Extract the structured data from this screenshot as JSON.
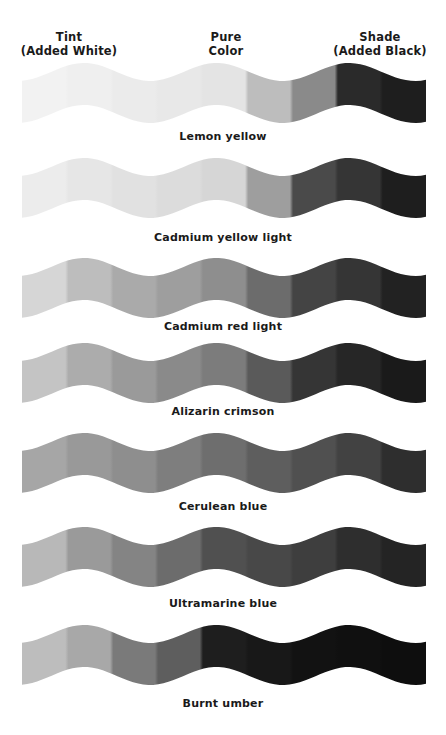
{
  "headers": {
    "tint": {
      "line1": "Tint",
      "line2": "(Added White)"
    },
    "pure": {
      "line1": "Pure",
      "line2": "Color"
    },
    "shade": {
      "line1": "Shade",
      "line2": "(Added Black)"
    }
  },
  "strips": [
    {
      "label": "Lemon yellow",
      "top": 58,
      "labelTop": 130,
      "grays": [
        "#f2f2f2",
        "#efefef",
        "#ebebeb",
        "#e8e8e8",
        "#e4e4e4",
        "#bdbdbd",
        "#8a8a8a",
        "#2a2a2a",
        "#1e1e1e"
      ]
    },
    {
      "label": "Cadmium yellow light",
      "top": 153,
      "labelTop": 231,
      "grays": [
        "#ececec",
        "#e6e6e6",
        "#e1e1e1",
        "#dcdcdc",
        "#d6d6d6",
        "#9e9e9e",
        "#4a4a4a",
        "#353535",
        "#1e1e1e"
      ]
    },
    {
      "label": "Cadmium red light",
      "top": 253,
      "labelTop": 320,
      "grays": [
        "#d6d6d6",
        "#bdbdbd",
        "#aaaaaa",
        "#9e9e9e",
        "#8e8e8e",
        "#6c6c6c",
        "#444444",
        "#353535",
        "#222222"
      ]
    },
    {
      "label": "Alizarin crimson",
      "top": 338,
      "labelTop": 405,
      "grays": [
        "#c4c4c4",
        "#acacac",
        "#9a9a9a",
        "#8a8a8a",
        "#7c7c7c",
        "#5a5a5a",
        "#353535",
        "#262626",
        "#1a1a1a"
      ]
    },
    {
      "label": "Cerulean blue",
      "top": 428,
      "labelTop": 500,
      "grays": [
        "#a6a6a6",
        "#999999",
        "#8e8e8e",
        "#7e7e7e",
        "#6e6e6e",
        "#5e5e5e",
        "#505050",
        "#424242",
        "#2e2e2e"
      ]
    },
    {
      "label": "Ultramarine blue",
      "top": 522,
      "labelTop": 597,
      "grays": [
        "#b8b8b8",
        "#9a9a9a",
        "#848484",
        "#6c6c6c",
        "#505050",
        "#484848",
        "#3e3e3e",
        "#2e2e2e",
        "#242424"
      ]
    },
    {
      "label": "Burnt umber",
      "top": 620,
      "labelTop": 697,
      "grays": [
        "#bdbdbd",
        "#a8a8a8",
        "#7a7a7a",
        "#5e5e5e",
        "#1e1e1e",
        "#181818",
        "#121212",
        "#101010",
        "#0e0e0e"
      ]
    }
  ]
}
